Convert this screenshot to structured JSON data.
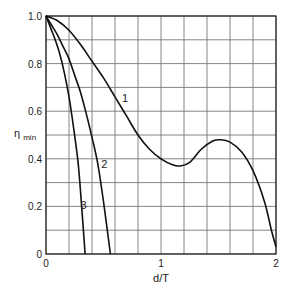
{
  "chart_data": {
    "type": "line",
    "title": "",
    "xlabel": "d/T",
    "ylabel": "η_min",
    "xlim": [
      0,
      2
    ],
    "ylim": [
      0,
      1.0
    ],
    "grid": true,
    "grid_x_step": 0.2,
    "grid_y_step": 0.1,
    "x_ticks": [
      {
        "value": 0,
        "label": "0"
      },
      {
        "value": 1,
        "label": "1"
      },
      {
        "value": 2,
        "label": "2"
      }
    ],
    "y_ticks": [
      {
        "value": 0,
        "label": "0"
      },
      {
        "value": 0.2,
        "label": "0.2"
      },
      {
        "value": 0.4,
        "label": "0.4"
      },
      {
        "value": 0.6,
        "label": "0.6"
      },
      {
        "value": 0.8,
        "label": "0.8"
      },
      {
        "value": 1.0,
        "label": "1.0"
      }
    ],
    "legend": "none (curves labeled inline)",
    "series": [
      {
        "name": "1",
        "label_pos": [
          0.66,
          0.64
        ],
        "x": [
          0,
          0.1,
          0.2,
          0.3,
          0.4,
          0.5,
          0.6,
          0.7,
          0.8,
          0.9,
          1.0,
          1.1,
          1.17,
          1.25,
          1.35,
          1.45,
          1.52,
          1.6,
          1.7,
          1.8,
          1.9,
          1.96,
          2.0
        ],
        "y": [
          1.0,
          0.98,
          0.94,
          0.88,
          0.81,
          0.74,
          0.66,
          0.58,
          0.5,
          0.44,
          0.4,
          0.375,
          0.37,
          0.385,
          0.44,
          0.475,
          0.48,
          0.47,
          0.43,
          0.35,
          0.22,
          0.1,
          0.03
        ]
      },
      {
        "name": "2",
        "label_pos": [
          0.48,
          0.36
        ],
        "x": [
          0,
          0.05,
          0.1,
          0.15,
          0.2,
          0.25,
          0.3,
          0.35,
          0.4,
          0.45,
          0.5,
          0.56
        ],
        "y": [
          1.0,
          0.96,
          0.92,
          0.87,
          0.82,
          0.75,
          0.68,
          0.59,
          0.49,
          0.38,
          0.22,
          0.0
        ]
      },
      {
        "name": "3",
        "label_pos": [
          0.3,
          0.19
        ],
        "x": [
          0,
          0.04,
          0.08,
          0.12,
          0.16,
          0.2,
          0.24,
          0.28,
          0.31,
          0.34
        ],
        "y": [
          1.0,
          0.95,
          0.9,
          0.84,
          0.76,
          0.66,
          0.53,
          0.38,
          0.2,
          0.0
        ]
      }
    ]
  },
  "axis": {
    "x_title": "d/T",
    "y_title_main": "η",
    "y_title_sub": "min"
  }
}
